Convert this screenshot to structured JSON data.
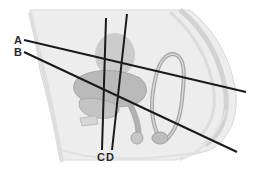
{
  "diagram": {
    "labels": {
      "a": "A",
      "b": "B",
      "c": "C",
      "d": "D"
    },
    "lines": [
      {
        "id": "A",
        "x1": 24,
        "y1": 40,
        "x2": 246,
        "y2": 92
      },
      {
        "id": "B",
        "x1": 24,
        "y1": 52,
        "x2": 237,
        "y2": 152
      },
      {
        "id": "C",
        "x1": 106,
        "y1": 18,
        "x2": 102,
        "y2": 150
      },
      {
        "id": "D",
        "x1": 127,
        "y1": 14,
        "x2": 112,
        "y2": 150
      }
    ],
    "colors": {
      "line": "#1a1a1a",
      "tissue_light": "#e6e6e6",
      "tissue_mid": "#cfcfcf",
      "tissue_dark": "#b3b3b3",
      "outline": "#a9a9a9",
      "background": "#ffffff"
    }
  }
}
